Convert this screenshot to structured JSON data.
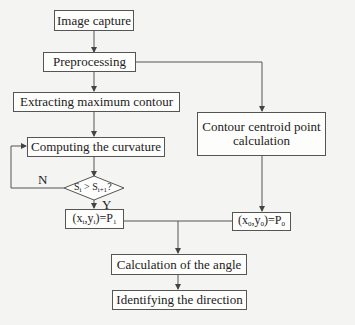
{
  "diagram": {
    "nodes": [
      {
        "id": "image_capture",
        "label": "Image capture",
        "shape": "rect"
      },
      {
        "id": "preprocessing",
        "label": "Preprocessing",
        "shape": "rect"
      },
      {
        "id": "extract_contour",
        "label": "Extracting maximum contour",
        "shape": "rect"
      },
      {
        "id": "curvature",
        "label": "Computing the curvature",
        "shape": "rect"
      },
      {
        "id": "decision",
        "label": "Si > Si+1?",
        "shape": "diamond"
      },
      {
        "id": "p1",
        "label": "(xi,yi)=P1",
        "shape": "rect"
      },
      {
        "id": "centroid",
        "label_line1": "Contour centroid point",
        "label_line2": "calculation",
        "shape": "rect"
      },
      {
        "id": "p0",
        "label": "(x0,y0)=P0",
        "shape": "rect"
      },
      {
        "id": "angle",
        "label": "Calculation of the angle",
        "shape": "rect"
      },
      {
        "id": "direction",
        "label": "Identifying the direction",
        "shape": "rect"
      }
    ],
    "edges": [
      {
        "from": "image_capture",
        "to": "preprocessing"
      },
      {
        "from": "preprocessing",
        "to": "extract_contour"
      },
      {
        "from": "preprocessing",
        "to": "centroid"
      },
      {
        "from": "extract_contour",
        "to": "curvature"
      },
      {
        "from": "curvature",
        "to": "decision"
      },
      {
        "from": "decision",
        "to": "curvature",
        "label": "N"
      },
      {
        "from": "decision",
        "to": "p1",
        "label": "Y"
      },
      {
        "from": "centroid",
        "to": "p0"
      },
      {
        "from": "p1",
        "to": "angle"
      },
      {
        "from": "p0",
        "to": "angle"
      },
      {
        "from": "angle",
        "to": "direction"
      }
    ],
    "labels": {
      "no": "N",
      "yes": "Y"
    },
    "decision_text": {
      "s": "S",
      "i": "i",
      "gt": " > ",
      "s2": "S",
      "i1": "i+1",
      "q": "?"
    },
    "p1_text": {
      "a": "(x",
      "i1": "i",
      "b": ",y",
      "i2": "i",
      "c": ")=P",
      "n": "1"
    },
    "p0_text": {
      "a": "(x",
      "i1": "0",
      "b": ",y",
      "i2": "0",
      "c": ")=P",
      "n": "0"
    }
  }
}
